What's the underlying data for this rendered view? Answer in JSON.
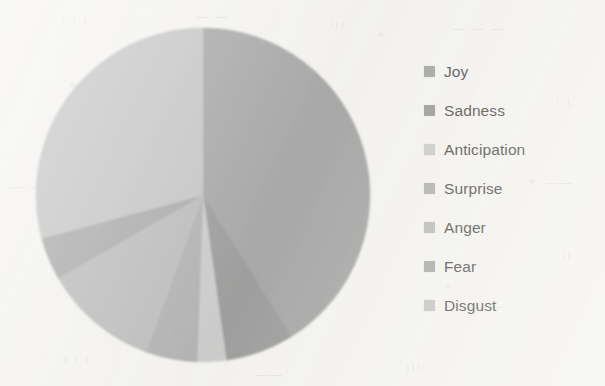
{
  "chart_data": {
    "type": "pie",
    "title": "",
    "subtitle": "",
    "xlabel": "",
    "ylabel": "",
    "grid": false,
    "legend_position": "right",
    "start_angle_deg": 0,
    "direction": "clockwise",
    "categories": [
      "Joy",
      "Sadness",
      "Anticipation",
      "Surprise",
      "Anger",
      "Fear",
      "Disgust"
    ],
    "values": [
      41.1,
      6.7,
      2.8,
      5.0,
      11.1,
      4.2,
      29.1
    ],
    "units": "percent",
    "colors": [
      "#9a9a9a",
      "#8e8e8e",
      "#c4c4c4",
      "#a6a6a6",
      "#b2b2b2",
      "#9e9e9e",
      "#bdbdbd"
    ],
    "slices": [
      {
        "label": "Joy",
        "value": 41.1,
        "start_deg": 0,
        "end_deg": 148,
        "color": "#9a9a9a"
      },
      {
        "label": "Sadness",
        "value": 6.7,
        "start_deg": 148,
        "end_deg": 172,
        "color": "#8e8e8e"
      },
      {
        "label": "Anticipation",
        "value": 2.8,
        "start_deg": 172,
        "end_deg": 182,
        "color": "#c4c4c4"
      },
      {
        "label": "Surprise",
        "value": 5.0,
        "start_deg": 182,
        "end_deg": 200,
        "color": "#a6a6a6"
      },
      {
        "label": "Anger",
        "value": 11.1,
        "start_deg": 200,
        "end_deg": 240,
        "color": "#b2b2b2"
      },
      {
        "label": "Fear",
        "value": 4.2,
        "start_deg": 240,
        "end_deg": 255,
        "color": "#9e9e9e"
      },
      {
        "label": "Disgust",
        "value": 29.1,
        "start_deg": 255,
        "end_deg": 360,
        "color": "#bdbdbd"
      }
    ]
  },
  "pie": {
    "center_x": 203,
    "center_y": 195,
    "radius": 167
  },
  "legend": {
    "items": [
      {
        "label": "Joy",
        "swatch": "#9a9a9a"
      },
      {
        "label": "Sadness",
        "swatch": "#8e8e8e"
      },
      {
        "label": "Anticipation",
        "swatch": "#c4c4c4"
      },
      {
        "label": "Surprise",
        "swatch": "#a6a6a6"
      },
      {
        "label": "Anger",
        "swatch": "#b2b2b2"
      },
      {
        "label": "Fear",
        "swatch": "#9e9e9e"
      },
      {
        "label": "Disgust",
        "swatch": "#bdbdbd"
      }
    ]
  },
  "background": {
    "page_color": "#f3f2ef",
    "bleed_through": [
      {
        "text": "ı ı ı",
        "x": 62,
        "y": 14
      },
      {
        "text": "— —",
        "x": 196,
        "y": 10
      },
      {
        "text": "ııı",
        "x": 330,
        "y": 18
      },
      {
        "text": "— — —",
        "x": 452,
        "y": 22
      },
      {
        "text": "ı ı",
        "x": 556,
        "y": 96
      },
      {
        "text": "——",
        "x": 546,
        "y": 176
      },
      {
        "text": "ıı",
        "x": 562,
        "y": 248
      },
      {
        "text": "— —",
        "x": 470,
        "y": 300
      },
      {
        "text": "ı ı ı",
        "x": 64,
        "y": 352
      },
      {
        "text": "——",
        "x": 256,
        "y": 368
      },
      {
        "text": "ııı",
        "x": 406,
        "y": 360
      },
      {
        "text": "— —",
        "x": 10,
        "y": 180
      }
    ]
  }
}
